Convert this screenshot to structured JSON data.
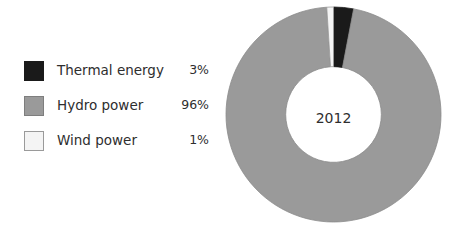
{
  "chart_data": {
    "type": "pie",
    "variant": "donut",
    "title": "",
    "subtitle": "",
    "xlabel": "",
    "ylabel": "",
    "center_label": "2012",
    "unit": "%",
    "grid": false,
    "legend_position": "left",
    "start_angle_deg": -90,
    "direction": "clockwise",
    "inner_radius_ratio": 0.445,
    "categories": [
      "Thermal energy",
      "Hydro power",
      "Wind power"
    ],
    "values": [
      3,
      96,
      1
    ],
    "value_labels": [
      "3%",
      "96%",
      "1%"
    ],
    "colors": [
      "#1a1a1a",
      "#9a9a9a",
      "#f4f4f4"
    ],
    "slices": [
      {
        "label": "Thermal energy",
        "value": 3,
        "display": "3%",
        "color": "#1a1a1a",
        "border": "#1a1a1a"
      },
      {
        "label": "Hydro power",
        "value": 96,
        "display": "96%",
        "color": "#9a9a9a",
        "border": "#8a8a8a"
      },
      {
        "label": "Wind power",
        "value": 1,
        "display": "1%",
        "color": "#f4f4f4",
        "border": "#9a9a9a"
      }
    ],
    "slice_order_clockwise_from_top": [
      "Thermal energy",
      "Hydro power",
      "Wind power"
    ]
  },
  "legend": {
    "items": [
      {
        "label": "Thermal energy",
        "value": "3%",
        "swatch": "#1a1a1a",
        "swatch_border": "#1a1a1a"
      },
      {
        "label": "Hydro power",
        "value": "96%",
        "swatch": "#9a9a9a",
        "swatch_border": "#7e7e7e"
      },
      {
        "label": "Wind power",
        "value": "1%",
        "swatch": "#f4f4f4",
        "swatch_border": "#9a9a9a"
      }
    ]
  },
  "donut": {
    "center_label": "2012"
  },
  "colors": {
    "background": "#ffffff",
    "text": "#2e2e2e",
    "thermal": "#1a1a1a",
    "hydro": "#9a9a9a",
    "wind": "#f4f4f4"
  }
}
